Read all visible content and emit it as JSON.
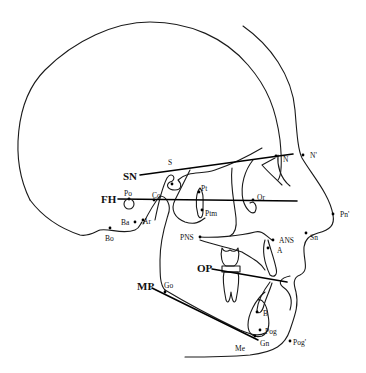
{
  "diagram": {
    "type": "cephalometric-tracing",
    "reference_planes": [
      {
        "id": "SN",
        "label": "SN"
      },
      {
        "id": "FH",
        "label": "FH"
      },
      {
        "id": "OP",
        "label": "OP"
      },
      {
        "id": "MP",
        "label": "MP"
      }
    ],
    "hard_tissue_landmarks": [
      {
        "id": "S",
        "label": "S"
      },
      {
        "id": "N",
        "label": "N"
      },
      {
        "id": "Po",
        "label": "Po"
      },
      {
        "id": "Or",
        "label": "Or"
      },
      {
        "id": "Co",
        "label": "Co"
      },
      {
        "id": "Pt",
        "label": "Pt"
      },
      {
        "id": "Ptm",
        "label": "Ptm"
      },
      {
        "id": "Ba",
        "label": "Ba"
      },
      {
        "id": "Ar",
        "label": "Ar"
      },
      {
        "id": "Bo",
        "label": "Bo"
      },
      {
        "id": "PNS",
        "label": "PNS"
      },
      {
        "id": "ANS",
        "label": "ANS"
      },
      {
        "id": "A",
        "label": "A"
      },
      {
        "id": "B",
        "label": "B"
      },
      {
        "id": "Pog",
        "label": "Pog"
      },
      {
        "id": "Gn",
        "label": "Gn"
      },
      {
        "id": "Me",
        "label": "Me"
      },
      {
        "id": "Go",
        "label": "Go"
      }
    ],
    "soft_tissue_landmarks": [
      {
        "id": "N_soft",
        "label": "N'"
      },
      {
        "id": "Pn_soft",
        "label": "Pn'"
      },
      {
        "id": "Sn",
        "label": "Sn"
      },
      {
        "id": "Pog_soft",
        "label": "Pog'"
      }
    ]
  }
}
